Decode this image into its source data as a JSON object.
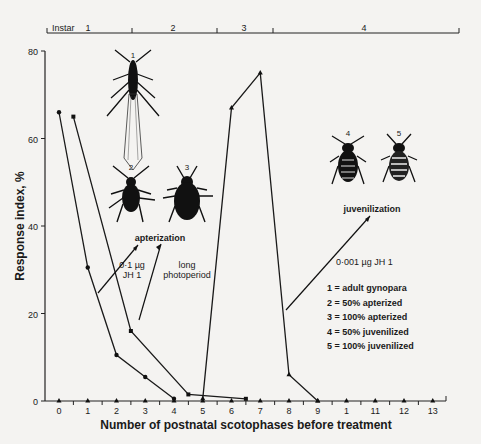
{
  "chart_data": {
    "type": "line",
    "title": "",
    "xlabel": "Number of postnatal scotophases before treatment",
    "ylabel": "Response index, %",
    "xlim": [
      0,
      13
    ],
    "ylim": [
      0,
      80
    ],
    "x_ticks": [
      "0",
      "1",
      "2",
      "3",
      "4",
      "5",
      "6",
      "7",
      "8",
      "9",
      "1",
      "11",
      "12",
      "13"
    ],
    "y_ticks": [
      "0",
      "20",
      "40",
      "60",
      "80"
    ],
    "grid": false,
    "instar_bar": {
      "label": "Instar",
      "segments": [
        {
          "label": "1",
          "from": -0.5,
          "to": 2.5
        },
        {
          "label": "2",
          "from": 2.5,
          "to": 5.5
        },
        {
          "label": "3",
          "from": 5.5,
          "to": 7.5
        },
        {
          "label": "4",
          "from": 7.5,
          "to": 14.0
        }
      ]
    },
    "series": [
      {
        "name": "0·1 µg JH 1 (apterization)",
        "marker": "circle",
        "x": [
          0,
          1,
          2,
          3,
          4
        ],
        "values": [
          66,
          30.5,
          10.5,
          5.5,
          0.5
        ]
      },
      {
        "name": "long photoperiod (apterization)",
        "marker": "square",
        "x": [
          0.5,
          2.5,
          4.5,
          6.5
        ],
        "values": [
          65,
          16,
          1.5,
          0.5
        ]
      },
      {
        "name": "0·001 µg JH 1 (juvenilization)",
        "marker": "triangle",
        "x": [
          5,
          6,
          7,
          8,
          9
        ],
        "values": [
          0.5,
          67,
          75,
          6,
          0
        ]
      },
      {
        "name": "baseline controls",
        "marker": "triangle",
        "x": [
          0,
          1,
          2,
          3,
          4,
          5,
          6,
          7,
          8,
          9,
          10,
          11,
          12,
          13
        ],
        "values": [
          0,
          0,
          0,
          0,
          0,
          0,
          0,
          0,
          0,
          0,
          0,
          0,
          0,
          0
        ]
      }
    ],
    "annotations": {
      "apterization": "apterization",
      "juvenilization": "juvenilization",
      "dose_high": [
        "0·1 µg",
        "JH 1"
      ],
      "long_photoperiod": [
        "long",
        "photoperiod"
      ],
      "dose_low": "0·001 µg JH 1",
      "insect_labels": [
        "1",
        "2",
        "3",
        "4",
        "5"
      ]
    },
    "legend": [
      "1 = adult gynopara",
      "2 = 50% apterized",
      "3 = 100% apterized",
      "4 = 50% juvenilized",
      "5 = 100% juvenilized"
    ],
    "legend_position": "right-middle"
  }
}
